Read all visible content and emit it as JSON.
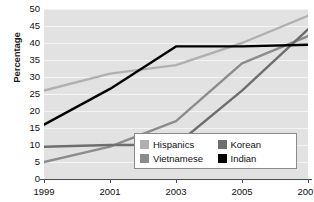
{
  "chart_data": {
    "type": "line",
    "title": "",
    "xlabel": "",
    "ylabel": "Percentage",
    "x": [
      1999,
      2001,
      2003,
      2005,
      2007
    ],
    "xtick_labels": [
      "1999",
      "2001",
      "2003",
      "2005",
      "2007"
    ],
    "ytick_labels": [
      "0",
      "5",
      "10",
      "15",
      "20",
      "25",
      "30",
      "35",
      "40",
      "45",
      "50"
    ],
    "ylim": [
      0,
      50
    ],
    "ytick_step": 5,
    "xlim": [
      1999,
      2007
    ],
    "grid": true,
    "legend_position": "bottom-right",
    "series": [
      {
        "name": "Hispanics",
        "color": "#b0b0b0",
        "values": [
          26,
          31,
          33.5,
          40,
          48
        ]
      },
      {
        "name": "Vietnamese",
        "color": "#8c8c8c",
        "values": [
          5,
          9.5,
          17,
          34,
          42
        ]
      },
      {
        "name": "Korean",
        "color": "#6e6e6e",
        "values": [
          9.5,
          10,
          10,
          26,
          44
        ]
      },
      {
        "name": "Indian",
        "color": "#000000",
        "values": [
          16,
          26.5,
          39,
          39,
          39.5
        ]
      }
    ]
  },
  "legend": {
    "entries": [
      {
        "label": "Hispanics",
        "color": "#b0b0b0"
      },
      {
        "label": "Korean",
        "color": "#6e6e6e"
      },
      {
        "label": "Vietnamese",
        "color": "#8c8c8c"
      },
      {
        "label": "Indian",
        "color": "#000000"
      }
    ]
  },
  "axes": {
    "y_title": "Percentage"
  },
  "colors": {
    "plot_background": "#e2e2e2",
    "gridline": "#f4f4f4",
    "axis": "#4a4a4a",
    "text": "#111111",
    "legend_background": "#ffffff",
    "legend_border": "#8a8a8a"
  }
}
